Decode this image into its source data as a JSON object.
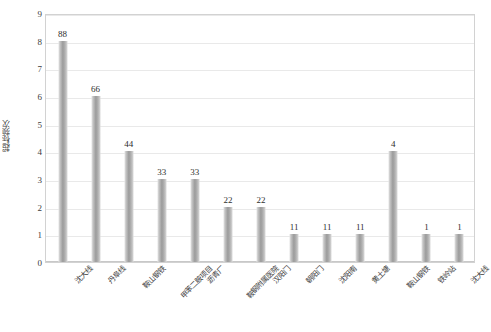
{
  "chart_data": {
    "type": "bar",
    "title": "",
    "subtitle": "",
    "xlabel": "",
    "ylabel": "超标频次",
    "ylim": [
      0,
      9
    ],
    "ytick_step": 1,
    "yticks": [
      9,
      8,
      7,
      6,
      5,
      4,
      3,
      2,
      1,
      0
    ],
    "grid": true,
    "legend": false,
    "legend_position": "none",
    "orientation": "vertical",
    "bar_color": "#9a9a9a",
    "categories": [
      "沈大线",
      "丹阜线",
      "鞍山钢铁",
      "甲苯二胺项目",
      "沥青厂",
      "鞍钢附属医院",
      "汉阳门",
      "朝阳门",
      "沈阳南",
      "黄土塘",
      "鞍山钢铁",
      "铁岭站",
      "沈大线"
    ],
    "values": [
      8,
      6,
      4,
      3,
      3,
      2,
      2,
      1,
      1,
      1,
      4,
      1,
      1
    ],
    "data_labels": [
      "88",
      "66",
      "44",
      "33",
      "33",
      "22",
      "22",
      "11",
      "11",
      "11",
      "4",
      "1",
      "1"
    ],
    "plot_border_color": "#d2d2d2",
    "gridline_color": "#e9e9e9",
    "background_color": "#ffffff"
  }
}
